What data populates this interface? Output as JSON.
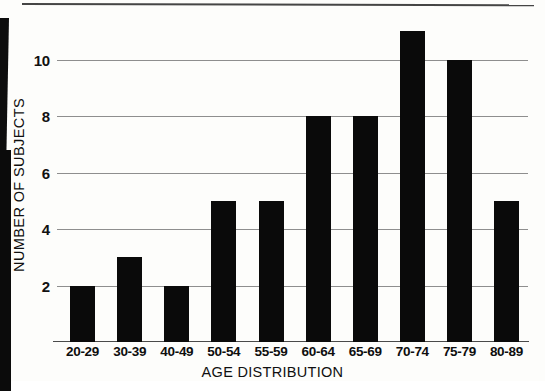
{
  "chart_data": {
    "type": "bar",
    "title": "",
    "xlabel": "AGE DISTRIBUTION",
    "ylabel": "NUMBER OF SUBJECTS",
    "categories": [
      "20-29",
      "30-39",
      "40-49",
      "50-54",
      "55-59",
      "60-64",
      "65-69",
      "70-74",
      "75-79",
      "80-89"
    ],
    "values": [
      2,
      3,
      2,
      5,
      5,
      8,
      8,
      11,
      10,
      5
    ],
    "yticks": [
      2,
      4,
      6,
      8,
      10
    ],
    "ylim": [
      0,
      11.4
    ],
    "grid": true,
    "legend": "none",
    "bar_color": "#0a0a0a",
    "gridline_color": "#8e8e8e",
    "background_color": "#fdfdfb"
  },
  "axes": {
    "y_title": "NUMBER OF SUBJECTS",
    "x_title": "AGE DISTRIBUTION",
    "y_tick_labels": [
      "10",
      "8",
      "6",
      "4",
      "2"
    ],
    "x_tick_labels": [
      "20-29",
      "30-39",
      "40-49",
      "50-54",
      "55-59",
      "60-64",
      "65-69",
      "70-74",
      "75-79",
      "80-89"
    ]
  }
}
